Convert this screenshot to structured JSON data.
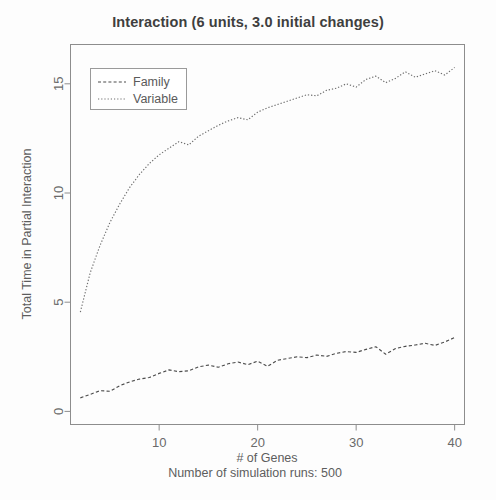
{
  "chart_data": {
    "type": "line",
    "title": "Interaction (6 units, 3.0 initial changes)",
    "xlabel": "# of Genes",
    "sublabel": "Number of simulation runs: 500",
    "ylabel": "Total Time in Partial Interaction",
    "xlim": [
      1,
      41
    ],
    "ylim": [
      -0.6,
      16.8
    ],
    "xticks": [
      10,
      20,
      30,
      40
    ],
    "yticks": [
      0,
      5,
      10,
      15
    ],
    "xtick_labels": [
      "10",
      "20",
      "30",
      "40"
    ],
    "ytick_labels": [
      "0",
      "5",
      "10",
      "15"
    ],
    "grid": false,
    "legend_position": "top-left",
    "x": [
      2,
      3,
      4,
      5,
      6,
      7,
      8,
      9,
      10,
      11,
      12,
      13,
      14,
      15,
      16,
      17,
      18,
      19,
      20,
      21,
      22,
      23,
      24,
      25,
      26,
      27,
      28,
      29,
      30,
      31,
      32,
      33,
      34,
      35,
      36,
      37,
      38,
      39,
      40
    ],
    "series": [
      {
        "name": "Family",
        "style": "dashed",
        "color": "#4c4c4c",
        "values": [
          0.62,
          0.78,
          0.95,
          0.92,
          1.18,
          1.35,
          1.48,
          1.55,
          1.74,
          1.9,
          1.82,
          1.86,
          2.04,
          2.12,
          2.02,
          2.18,
          2.26,
          2.14,
          2.3,
          2.06,
          2.34,
          2.42,
          2.5,
          2.46,
          2.58,
          2.52,
          2.66,
          2.74,
          2.7,
          2.84,
          2.96,
          2.62,
          2.88,
          2.98,
          3.04,
          3.12,
          3.02,
          3.18,
          3.38
        ]
      },
      {
        "name": "Variable",
        "style": "dotted",
        "color": "#6e6e6e",
        "values": [
          4.55,
          6.35,
          7.6,
          8.65,
          9.5,
          10.25,
          10.85,
          11.35,
          11.75,
          12.05,
          12.35,
          12.2,
          12.6,
          12.85,
          13.1,
          13.3,
          13.45,
          13.35,
          13.7,
          13.9,
          14.05,
          14.2,
          14.35,
          14.5,
          14.45,
          14.7,
          14.8,
          15.0,
          14.85,
          15.2,
          15.35,
          15.05,
          15.25,
          15.55,
          15.3,
          15.45,
          15.6,
          15.4,
          15.75
        ]
      }
    ]
  },
  "legend": {
    "items": [
      {
        "label": "Family"
      },
      {
        "label": "Variable"
      }
    ]
  }
}
